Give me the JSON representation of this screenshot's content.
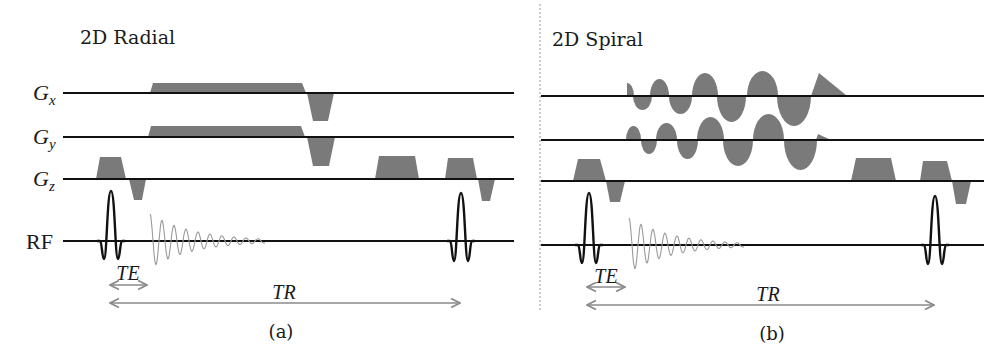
{
  "colors": {
    "gradient_fill": "#7a7a7a",
    "baseline": "#111111",
    "fid": "#9a9a9a",
    "arrow": "#8a8a8a",
    "text": "#1a1a1a"
  },
  "panels": [
    {
      "id": "radial",
      "title": "2D Radial",
      "caption": "(a)",
      "title_pos": [
        80,
        44
      ],
      "caption_pos": [
        281,
        338
      ],
      "axis_labels": [
        {
          "main": "G",
          "sub": "x",
          "x": 33,
          "y": 100
        },
        {
          "main": "G",
          "sub": "y",
          "x": 33,
          "y": 144
        },
        {
          "main": "G",
          "sub": "z",
          "x": 33,
          "y": 186
        },
        {
          "main": "RF",
          "sub": "",
          "x": 26,
          "y": 249
        }
      ],
      "baselines": [
        {
          "name": "gx",
          "x1": 63,
          "x2": 514,
          "y": 93
        },
        {
          "name": "gy",
          "x1": 63,
          "x2": 514,
          "y": 137
        },
        {
          "name": "gz",
          "x1": 63,
          "x2": 514,
          "y": 179
        },
        {
          "name": "rf",
          "x1": 63,
          "x2": 514,
          "y": 241
        }
      ],
      "trapezoids": [
        {
          "name": "gx-readout",
          "base": 93,
          "x1": 150,
          "x2": 153,
          "x3": 302,
          "x4": 306,
          "peak": 83
        },
        {
          "name": "gx-rewinder",
          "base": 93,
          "x1": 307,
          "x2": 313,
          "x3": 328,
          "x4": 334,
          "peak": 121
        },
        {
          "name": "gy-readout",
          "base": 137,
          "x1": 148,
          "x2": 151,
          "x3": 301,
          "x4": 305,
          "peak": 126
        },
        {
          "name": "gy-rewinder",
          "base": 137,
          "x1": 307,
          "x2": 313,
          "x3": 329,
          "x4": 335,
          "peak": 166
        },
        {
          "name": "gz-slice-select-1",
          "base": 179,
          "x1": 96,
          "x2": 100,
          "x3": 121,
          "x4": 126,
          "peak": 157
        },
        {
          "name": "gz-refocus-1",
          "base": 179,
          "x1": 129,
          "x2": 134,
          "x3": 142,
          "x4": 146,
          "peak": 200
        },
        {
          "name": "gz-spoiler",
          "base": 179,
          "x1": 375,
          "x2": 379,
          "x3": 415,
          "x4": 419,
          "peak": 156
        },
        {
          "name": "gz-slice-select-2",
          "base": 179,
          "x1": 445,
          "x2": 448,
          "x3": 473,
          "x4": 477,
          "peak": 158
        },
        {
          "name": "gz-refocus-2",
          "base": 179,
          "x1": 478,
          "x2": 482,
          "x3": 490,
          "x4": 495,
          "peak": 201
        }
      ],
      "lobes": [],
      "rf_pulses": [
        {
          "cx": 111,
          "base": 241,
          "top": 191,
          "lobe_bottom": 259
        },
        {
          "cx": 461,
          "base": 241,
          "top": 193,
          "lobe_bottom": 261
        }
      ],
      "fid": {
        "x0": 150,
        "base": 241,
        "amp": 27,
        "period": 12,
        "length": 115
      },
      "timing": [
        {
          "label": "TE",
          "x1": 110,
          "x2": 147,
          "y": 285,
          "label_x": 128,
          "label_y": 280
        },
        {
          "label": "TR",
          "x1": 110,
          "x2": 460,
          "y": 303,
          "label_x": 284,
          "label_y": 299
        }
      ]
    },
    {
      "id": "spiral",
      "title": "2D Spiral",
      "caption": "(b)",
      "title_pos": [
        552,
        46
      ],
      "caption_pos": [
        772,
        340
      ],
      "axis_labels": [],
      "baselines": [
        {
          "name": "gx",
          "x1": 541,
          "x2": 984,
          "y": 96
        },
        {
          "name": "gy",
          "x1": 541,
          "x2": 984,
          "y": 140
        },
        {
          "name": "gz",
          "x1": 541,
          "x2": 984,
          "y": 181
        },
        {
          "name": "rf",
          "x1": 541,
          "x2": 984,
          "y": 245
        }
      ],
      "trapezoids": [
        {
          "name": "gz-slice-select-1",
          "base": 181,
          "x1": 573,
          "x2": 578,
          "x3": 600,
          "x4": 606,
          "peak": 159
        },
        {
          "name": "gz-refocus-1",
          "base": 181,
          "x1": 606,
          "x2": 610,
          "x3": 620,
          "x4": 625,
          "peak": 202
        },
        {
          "name": "gz-spoiler",
          "base": 181,
          "x1": 851,
          "x2": 856,
          "x3": 891,
          "x4": 896,
          "peak": 158
        },
        {
          "name": "gz-slice-select-2",
          "base": 181,
          "x1": 920,
          "x2": 923,
          "x3": 947,
          "x4": 952,
          "peak": 161
        },
        {
          "name": "gz-refocus-2",
          "base": 181,
          "x1": 952,
          "x2": 956,
          "x3": 966,
          "x4": 971,
          "peak": 204
        }
      ],
      "lobes": [
        {
          "axis": "gx",
          "base": 96,
          "x1": 627,
          "x2": 634,
          "peak": 83,
          "half": "right"
        },
        {
          "axis": "gx",
          "base": 96,
          "x1": 633,
          "x2": 652,
          "peak": 110
        },
        {
          "axis": "gx",
          "base": 96,
          "x1": 650,
          "x2": 669,
          "peak": 79
        },
        {
          "axis": "gx",
          "base": 96,
          "x1": 669,
          "x2": 692,
          "peak": 114
        },
        {
          "axis": "gx",
          "base": 96,
          "x1": 692,
          "x2": 718,
          "peak": 73
        },
        {
          "axis": "gx",
          "base": 96,
          "x1": 717,
          "x2": 746,
          "peak": 122
        },
        {
          "axis": "gx",
          "base": 96,
          "x1": 747,
          "x2": 778,
          "peak": 71
        },
        {
          "axis": "gx",
          "base": 96,
          "x1": 777,
          "x2": 811,
          "peak": 126
        },
        {
          "axis": "gy",
          "base": 140,
          "x1": 626,
          "x2": 641,
          "peak": 126
        },
        {
          "axis": "gy",
          "base": 140,
          "x1": 641,
          "x2": 657,
          "peak": 154
        },
        {
          "axis": "gy",
          "base": 140,
          "x1": 656,
          "x2": 677,
          "peak": 123
        },
        {
          "axis": "gy",
          "base": 140,
          "x1": 677,
          "x2": 698,
          "peak": 159
        },
        {
          "axis": "gy",
          "base": 140,
          "x1": 697,
          "x2": 724,
          "peak": 117
        },
        {
          "axis": "gy",
          "base": 140,
          "x1": 723,
          "x2": 753,
          "peak": 166
        },
        {
          "axis": "gy",
          "base": 140,
          "x1": 753,
          "x2": 784,
          "peak": 114
        },
        {
          "axis": "gy",
          "base": 140,
          "x1": 784,
          "x2": 817,
          "peak": 170
        }
      ],
      "ramps": [
        {
          "axis": "gx",
          "base": 96,
          "x_start": 811,
          "x_peak": 819,
          "peak": 73,
          "x_end": 847
        },
        {
          "axis": "gy",
          "base": 140,
          "x_start": 816,
          "x_peak": 818,
          "peak": 134,
          "x_end": 831
        }
      ],
      "rf_pulses": [
        {
          "cx": 589,
          "base": 245,
          "top": 193,
          "lobe_bottom": 263
        },
        {
          "cx": 935,
          "base": 245,
          "top": 196,
          "lobe_bottom": 264
        }
      ],
      "fid": {
        "x0": 629,
        "base": 245,
        "amp": 27,
        "period": 12,
        "length": 115
      },
      "timing": [
        {
          "label": "TE",
          "x1": 587,
          "x2": 625,
          "y": 287,
          "label_x": 606,
          "label_y": 283
        },
        {
          "label": "TR",
          "x1": 587,
          "x2": 934,
          "y": 305,
          "label_x": 768,
          "label_y": 301
        }
      ]
    }
  ],
  "divider": {
    "x": 540,
    "y1": 4,
    "y2": 310
  }
}
